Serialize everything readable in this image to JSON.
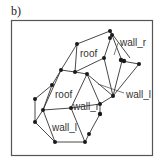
{
  "panel": {
    "label": "b)"
  },
  "labels": {
    "roof_upper": "roof",
    "roof_lower": "roof",
    "wall_r_upper": "wall_r",
    "wall_r_lower": "wall_r",
    "wall_l_right": "wall_l",
    "wall_l_lower": "wall_l"
  },
  "colors": {
    "line": "#333333",
    "node": "#1a1a1a",
    "frame": "#555555",
    "background": "#ffffff"
  }
}
